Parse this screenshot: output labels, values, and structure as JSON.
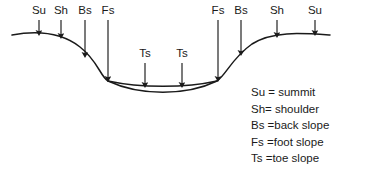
{
  "diagram": {
    "background_color": "#ffffff",
    "line_color": "#1a1a1a",
    "text_color": "#1a1a1a",
    "terrain": {
      "description": "Valley cross-section profile with plateau, back slope, valley floor and opposite rise",
      "surface_path": "M 12 35 C 40 30, 62 33, 80 47 C 98 61, 100 76, 108 81 C 140 88, 186 88, 217 81 C 226 75, 232 58, 252 44 C 272 31, 300 33, 330 35",
      "fill_path": "M 108 81 C 140 96, 186 96, 217 81"
    },
    "arrows": [
      {
        "label": "Su",
        "x": 39,
        "label_y": 14,
        "stem_top": 20,
        "stem_bottom": 33
      },
      {
        "label": "Sh",
        "x": 61,
        "label_y": 14,
        "stem_top": 20,
        "stem_bottom": 36
      },
      {
        "label": "Bs",
        "x": 85,
        "label_y": 14,
        "stem_top": 20,
        "stem_bottom": 55
      },
      {
        "label": "Fs",
        "x": 108,
        "label_y": 14,
        "stem_top": 20,
        "stem_bottom": 79
      },
      {
        "label": "Ts",
        "x": 145,
        "label_y": 57,
        "stem_top": 63,
        "stem_bottom": 85
      },
      {
        "label": "Ts",
        "x": 182,
        "label_y": 57,
        "stem_top": 63,
        "stem_bottom": 85
      },
      {
        "label": "Fs",
        "x": 218,
        "label_y": 14,
        "stem_top": 20,
        "stem_bottom": 79
      },
      {
        "label": "Bs",
        "x": 241,
        "label_y": 14,
        "stem_top": 20,
        "stem_bottom": 53
      },
      {
        "label": "Sh",
        "x": 277,
        "label_y": 14,
        "stem_top": 20,
        "stem_bottom": 35
      },
      {
        "label": "Su",
        "x": 315,
        "label_y": 14,
        "stem_top": 20,
        "stem_bottom": 33
      }
    ]
  },
  "legend": {
    "entries": [
      {
        "text": "Su = summit"
      },
      {
        "text": "Sh= shoulder"
      },
      {
        "text": "Bs =back slope"
      },
      {
        "text": "Fs =foot slope"
      },
      {
        "text": "Ts =toe slope"
      }
    ]
  }
}
